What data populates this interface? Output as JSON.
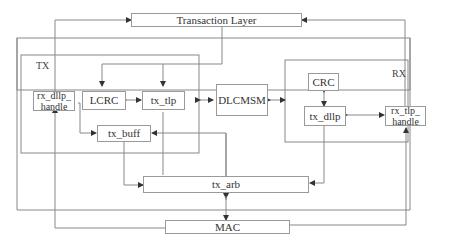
{
  "diagram": {
    "blocks": {
      "transaction_layer": "Transaction Layer",
      "mac": "MAC",
      "lcrc": "LCRC",
      "tx_tlp": "tx_tlp",
      "rx_dllp_handle": "rx_dllp_ handle",
      "tx_buff": "tx_buff",
      "dlcmsm": "DLCMSM",
      "crc": "CRC",
      "tx_dllp": "tx_dllp",
      "rx_tlp_handle": "rx_tlp_ handle",
      "tx_arb": "tx_arb"
    },
    "groups": {
      "tx": "TX",
      "rx": "RX"
    }
  }
}
